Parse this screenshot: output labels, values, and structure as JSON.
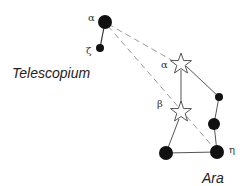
{
  "constellations": [
    {
      "name": "Telescopium",
      "label_pos": [
        12,
        78
      ]
    },
    {
      "name": "Ara",
      "label_pos": [
        202,
        183
      ]
    }
  ],
  "stars": [
    {
      "id": "tel-alpha",
      "label": "α",
      "type": "dot",
      "x": 105,
      "y": 22,
      "r": 7,
      "label_pos": [
        88,
        21
      ]
    },
    {
      "id": "tel-zeta",
      "label": "ζ",
      "type": "dot",
      "x": 100,
      "y": 48,
      "r": 4,
      "label_pos": [
        86,
        54
      ]
    },
    {
      "id": "ara-alpha",
      "label": "α",
      "type": "star",
      "x": 181,
      "y": 64,
      "r": 10,
      "label_pos": [
        161,
        68
      ]
    },
    {
      "id": "ara-beta",
      "label": "β",
      "type": "star",
      "x": 181,
      "y": 112,
      "r": 10,
      "label_pos": [
        157,
        107
      ]
    },
    {
      "id": "ara-small",
      "label": "",
      "type": "dot",
      "x": 219,
      "y": 97,
      "r": 4
    },
    {
      "id": "ara-mid",
      "label": "",
      "type": "dot",
      "x": 214,
      "y": 124,
      "r": 6
    },
    {
      "id": "ara-bl",
      "label": "",
      "type": "dot",
      "x": 166,
      "y": 153,
      "r": 7
    },
    {
      "id": "ara-eta",
      "label": "η",
      "type": "dot",
      "x": 217,
      "y": 152,
      "r": 7,
      "label_pos": [
        229,
        153
      ]
    }
  ],
  "colors": {
    "line": "#555555",
    "dash": "#999999",
    "star_fill": "#111111"
  }
}
